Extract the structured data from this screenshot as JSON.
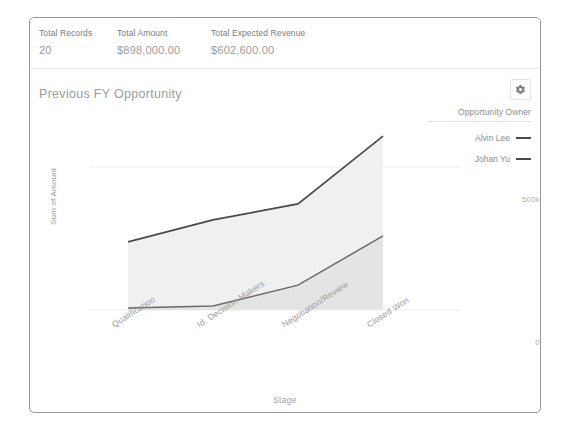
{
  "header": {
    "metrics": [
      {
        "label": "Total Records",
        "value": "20"
      },
      {
        "label": "Total Amount",
        "value": "$898,000.00"
      },
      {
        "label": "Total Expected Revenue",
        "value": "$602,600.00"
      }
    ]
  },
  "panel": {
    "title": "Previous FY Opportunity",
    "settings_icon": "gear-icon"
  },
  "legend": {
    "title": "Opportunity Owner",
    "items": [
      {
        "label": "Alvin Lee",
        "color": "#4a4a4a"
      },
      {
        "label": "Johan Yu",
        "color": "#4a4a4a"
      }
    ]
  },
  "chart_data": {
    "type": "area",
    "stacked": true,
    "title": "Previous FY Opportunity",
    "xlabel": "Stage",
    "ylabel": "Sum of Amount",
    "categories": [
      "Qualification",
      "Id. Decision Makers",
      "Negotiation/Review",
      "Closed Won"
    ],
    "series": [
      {
        "name": "Alvin Lee",
        "values": [
          231000,
          301000,
          284000,
          349000
        ],
        "color": "#4a4a4a",
        "fill": "#f0f0f0"
      },
      {
        "name": "Johan Yu",
        "values": [
          7000,
          14000,
          87000,
          259000
        ],
        "color": "#6a6a6a",
        "fill": "#e4e4e4"
      }
    ],
    "cumulative_totals": [
      238000,
      315000,
      371000,
      608000
    ],
    "ylim": [
      0,
      700000
    ],
    "yticks": [
      0,
      500000
    ],
    "ytick_labels": [
      "0",
      "500k"
    ],
    "grid": true,
    "legend_position": "right"
  }
}
